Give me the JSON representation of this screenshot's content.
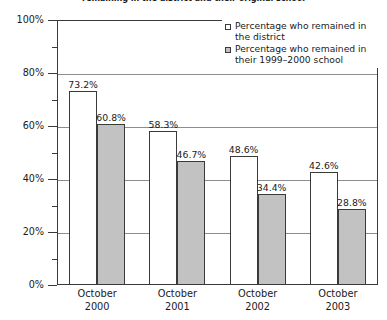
{
  "chart_data": {
    "type": "bar",
    "title": "remaining in the district and their original school",
    "xlabel": "",
    "ylabel": "",
    "ylim": [
      0,
      100
    ],
    "ytick_labels": [
      "0%",
      "20%",
      "40%",
      "60%",
      "80%",
      "100%"
    ],
    "ytick_values": [
      0,
      20,
      40,
      60,
      80,
      100
    ],
    "yminor_values": [
      10,
      30,
      50,
      70,
      90
    ],
    "grid": true,
    "grid_axis": "y",
    "legend_position": "top-right",
    "value_suffix": "%",
    "categories": [
      "October 2000",
      "October 2001",
      "October 2002",
      "October 2003"
    ],
    "category_lines": [
      [
        "October",
        "2000"
      ],
      [
        "October",
        "2001"
      ],
      [
        "October",
        "2002"
      ],
      [
        "October",
        "2003"
      ]
    ],
    "series": [
      {
        "name": "Percentage who remained in the district",
        "name_lines": [
          "Percentage who remained in",
          "the district"
        ],
        "color": "#ffffff",
        "values": [
          73.2,
          58.3,
          48.6,
          42.6
        ],
        "labels": [
          "73.2%",
          "58.3%",
          "48.6%",
          "42.6%"
        ]
      },
      {
        "name": "Percentage who remained in their 1999–2000 school",
        "name_lines": [
          "Percentage who remained in",
          "their 1999–2000 school"
        ],
        "color": "#c2c2c2",
        "values": [
          60.8,
          46.7,
          34.4,
          28.8
        ],
        "labels": [
          "60.8%",
          "46.7%",
          "34.4%",
          "28.8%"
        ]
      }
    ]
  },
  "colors": {
    "series_light": "#ffffff",
    "series_dark": "#c2c2c2",
    "axis": "#3a3a3a",
    "gridline": "#8d8d8d",
    "text": "#1a1a1a",
    "background": "#ffffff"
  }
}
